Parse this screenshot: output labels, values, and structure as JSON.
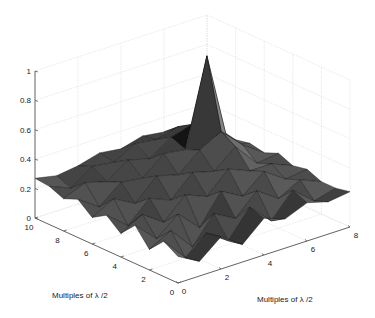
{
  "chart_data": {
    "type": "surface3d",
    "title": "",
    "xlabel": "Multiples of λ /2",
    "ylabel": "Multiples of λ /2",
    "zlabel": "",
    "x_ticks": [
      0,
      2,
      4,
      6,
      8
    ],
    "y_ticks": [
      0,
      2,
      4,
      6,
      8,
      10
    ],
    "z_ticks": [
      "0",
      "0.2",
      "0.4",
      "0.6",
      "0.8",
      "1"
    ],
    "xlim": [
      0,
      8
    ],
    "ylim": [
      0,
      10
    ],
    "zlim": [
      0,
      1
    ],
    "grid": true,
    "colormap": "gray",
    "x": [
      0,
      1,
      2,
      3,
      4,
      5,
      6,
      7,
      8
    ],
    "y": [
      0,
      1,
      2,
      3,
      4,
      5,
      6,
      7,
      8,
      9,
      10
    ],
    "z": [
      [
        0.18,
        0.1,
        0.22,
        0.12,
        0.25,
        0.2,
        0.26,
        0.22,
        0.24
      ],
      [
        0.24,
        0.08,
        0.2,
        0.1,
        0.28,
        0.14,
        0.3,
        0.18,
        0.22
      ],
      [
        0.14,
        0.22,
        0.06,
        0.24,
        0.16,
        0.3,
        0.2,
        0.28,
        0.22
      ],
      [
        0.26,
        0.12,
        0.24,
        0.1,
        0.3,
        0.22,
        0.34,
        0.24,
        0.26
      ],
      [
        0.16,
        0.24,
        0.14,
        0.28,
        0.22,
        0.36,
        0.3,
        0.3,
        0.24
      ],
      [
        0.24,
        0.12,
        0.26,
        0.2,
        0.34,
        0.3,
        0.42,
        0.26,
        0.28
      ],
      [
        0.18,
        0.26,
        0.18,
        0.32,
        0.28,
        0.4,
        0.48,
        0.34,
        0.24
      ],
      [
        0.26,
        0.16,
        0.28,
        0.26,
        0.38,
        0.36,
        0.95,
        0.3,
        0.26
      ],
      [
        0.22,
        0.28,
        0.24,
        0.34,
        0.3,
        0.4,
        0.44,
        0.32,
        0.24
      ],
      [
        0.26,
        0.2,
        0.3,
        0.28,
        0.36,
        0.34,
        0.38,
        0.28,
        0.26
      ],
      [
        0.27,
        0.24,
        0.26,
        0.3,
        0.28,
        0.32,
        0.3,
        0.28,
        0.25
      ]
    ],
    "peak": {
      "x": 6,
      "y": 7,
      "z": 0.95
    },
    "legend": null
  },
  "colors": {
    "axis": "#555555",
    "grid": "#e4e4e4",
    "surface_dark": "#151515",
    "surface_light": "#8a8a8a"
  }
}
